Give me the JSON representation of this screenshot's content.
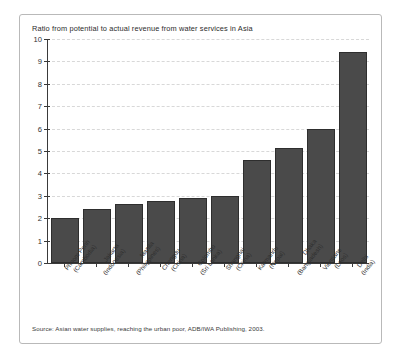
{
  "figure": {
    "title": "Ratio from potential to actual revenue from water services in Asia",
    "source": "Source: Asian water supplies, reaching the urban poor, ADB/IWA Publishing, 2003."
  },
  "colors": {
    "bar_fill": "#4a4a4a",
    "bar_edge": "#2e2e2e",
    "gridline": "#d8d8d8",
    "axis": "#3a3a3a",
    "frame": "#b9b9b9",
    "background": "#ffffff"
  },
  "chart_data": {
    "type": "bar",
    "title": "Ratio from potential to actual revenue from water services in Asia",
    "xlabel": "",
    "ylabel": "",
    "ylim": [
      0,
      10
    ],
    "yticks": [
      0,
      1,
      2,
      3,
      4,
      5,
      6,
      7,
      8,
      9,
      10
    ],
    "ytick_labels": [
      "0",
      "1",
      "2",
      "3",
      "4",
      "5",
      "6",
      "7",
      "8",
      "9",
      "10"
    ],
    "grid": true,
    "grid_style": "dashed horizontal",
    "legend": false,
    "categories": [
      "Phnom Penh (Cambodia)",
      "Jakarta (Indonesia)",
      "Manila (Philippines)",
      "Chengdu (China)",
      "Colombo (Sri Lanka)",
      "Shanghai (China)",
      "Katmandu (Nepal)",
      "Dhaka (Bangladesh)",
      "Vientiane (Laos)",
      "Delhi (India)"
    ],
    "cities": [
      "Phnom Penh",
      "Jakarta",
      "Manila",
      "Chengdu",
      "Colombo",
      "Shanghai",
      "Katmandu",
      "Dhaka",
      "Vientiane",
      "Delhi"
    ],
    "countries": [
      "(Cambodia)",
      "(Indonesia)",
      "(Philippines)",
      "(China)",
      "(Sri Lanka)",
      "(China)",
      "(Nepal)",
      "(Bangladesh)",
      "(Laos)",
      "(India)"
    ],
    "values": [
      2.0,
      2.4,
      2.65,
      2.75,
      2.9,
      3.0,
      4.6,
      5.15,
      6.0,
      9.4
    ]
  }
}
